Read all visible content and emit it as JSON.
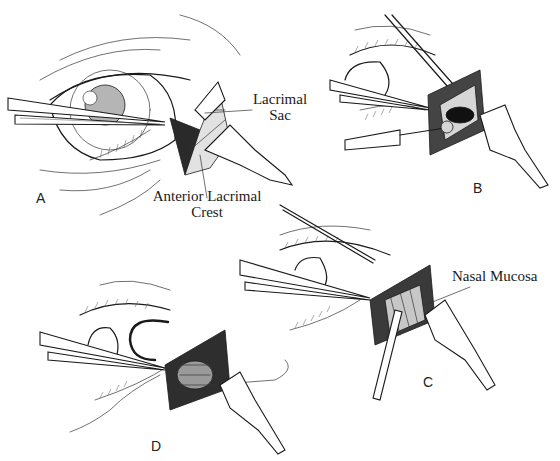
{
  "figure": {
    "panels": [
      {
        "id": "A",
        "letter": "A",
        "labels": {
          "lacrimal_sac_line1": "Lacrimal",
          "lacrimal_sac_line2": "Sac",
          "anterior_crest_line1": "Anterior Lacrimal",
          "anterior_crest_line2": "Crest"
        }
      },
      {
        "id": "B",
        "letter": "B"
      },
      {
        "id": "C",
        "letter": "C",
        "labels": {
          "nasal_mucosa": "Nasal Mucosa"
        }
      },
      {
        "id": "D",
        "letter": "D"
      }
    ]
  }
}
